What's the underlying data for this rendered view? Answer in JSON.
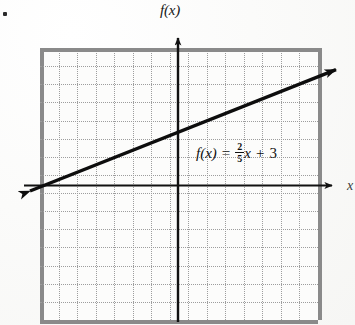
{
  "figure": {
    "kind": "coordinate-graph",
    "axis_labels": {
      "y": "f(x)",
      "x": "x"
    },
    "equation": {
      "full_text": "f(x) = 2/5 x + 3",
      "lhs": "f(x)",
      "equals": "=",
      "numerator": "2",
      "denominator": "5",
      "variable": "x",
      "plus": "+",
      "constant": "3"
    },
    "colors": {
      "line": "#0d0d0d",
      "axis": "#111111",
      "grid": "#9d9d9d",
      "background": "#fcfcfb"
    }
  },
  "chart_data": {
    "type": "line",
    "title": "",
    "xlabel": "x",
    "ylabel": "f(x)",
    "equation": "f(x) = (2/5)x + 3",
    "slope": 0.4,
    "intercept": 3,
    "grid": true,
    "legend": "none",
    "xlim": [
      -7.8,
      7.8
    ],
    "ylim": [
      -7.8,
      7.8
    ],
    "xticks": [
      -7,
      -6,
      -5,
      -4,
      -3,
      -2,
      -1,
      0,
      1,
      2,
      3,
      4,
      5,
      6,
      7
    ],
    "yticks": [
      -7,
      -6,
      -5,
      -4,
      -3,
      -2,
      -1,
      0,
      1,
      2,
      3,
      4,
      5,
      6,
      7
    ],
    "tick_labels_shown": false,
    "series": [
      {
        "name": "f(x) = (2/5)x + 3",
        "x": [
          -7.5,
          7.5
        ],
        "y": [
          0,
          6
        ],
        "points_of_interest": [
          {
            "label": "y-intercept",
            "x": 0,
            "y": 3
          },
          {
            "label": "x-intercept",
            "x": -7.5,
            "y": 0
          }
        ],
        "arrows": "both"
      }
    ]
  }
}
